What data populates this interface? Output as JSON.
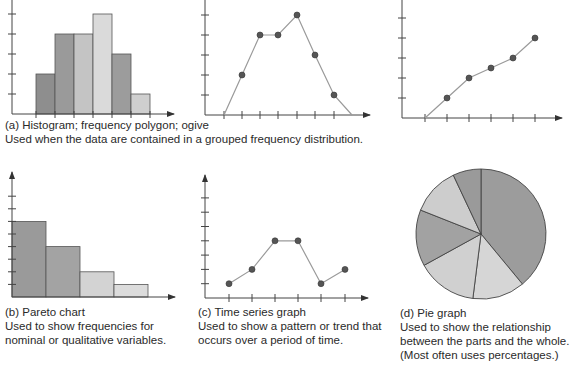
{
  "chart_data": [
    {
      "id": "a1",
      "type": "bar",
      "title": "Histogram",
      "categories": [
        "1",
        "2",
        "3",
        "4",
        "5",
        "6"
      ],
      "values": [
        2,
        4,
        4,
        5,
        3,
        1
      ],
      "bar_colors": [
        "#8e8e8e",
        "#9a9a9a",
        "#c4c4c4",
        "#dadada",
        "#9c9c9c",
        "#cfcfcf"
      ],
      "xlabel": "",
      "ylabel": "",
      "ylim": [
        0,
        6
      ],
      "grid": false,
      "tick_labels": false
    },
    {
      "id": "a2",
      "type": "line",
      "title": "Frequency polygon",
      "x": [
        0,
        1,
        2,
        3,
        4,
        5,
        6,
        7
      ],
      "values": [
        0,
        2,
        4,
        4,
        5,
        3,
        1,
        0
      ],
      "markers_on": [
        1,
        2,
        3,
        4,
        5,
        6
      ],
      "xlabel": "",
      "ylabel": "",
      "ylim": [
        0,
        6
      ],
      "grid": false
    },
    {
      "id": "a3",
      "type": "line",
      "title": "Ogive",
      "x": [
        0,
        1,
        2,
        3,
        4,
        5
      ],
      "values": [
        0,
        1,
        2,
        2.5,
        3,
        4
      ],
      "markers_on": [
        1,
        2,
        3,
        4,
        5
      ],
      "xlabel": "",
      "ylabel": "",
      "ylim": [
        0,
        6
      ],
      "grid": false
    },
    {
      "id": "b",
      "type": "bar",
      "title": "Pareto chart",
      "categories": [
        "1",
        "2",
        "3",
        "4"
      ],
      "values": [
        6,
        4,
        2,
        1
      ],
      "bar_colors": [
        "#9a9a9a",
        "#a3a3a3",
        "#d3d3d3",
        "#dcdcdc"
      ],
      "xlabel": "",
      "ylabel": "",
      "ylim": [
        0,
        8
      ],
      "grid": false
    },
    {
      "id": "c",
      "type": "line",
      "title": "Time series graph",
      "x": [
        1,
        2,
        3,
        4,
        5,
        6
      ],
      "values": [
        1,
        2,
        4,
        4,
        1,
        2
      ],
      "xlabel": "",
      "ylabel": "",
      "ylim": [
        0,
        7
      ],
      "grid": false
    },
    {
      "id": "d",
      "type": "pie",
      "title": "Pie graph",
      "values": [
        39,
        13,
        15,
        14,
        12,
        7
      ],
      "slice_colors": [
        "#9c9c9c",
        "#d6d6d6",
        "#d0d0d0",
        "#a2a2a2",
        "#cdcdcd",
        "#9a9a9a"
      ]
    }
  ],
  "captions": {
    "a": {
      "title": "(a) Histogram; frequency polygon; ogive",
      "desc": "Used when the data are contained in a grouped frequency distribution."
    },
    "b": {
      "title": "(b) Pareto chart",
      "line1": "Used to show frequencies for",
      "line2": "nominal or qualitative variables."
    },
    "c": {
      "title": "(c) Time series graph",
      "line1": "Used to show a pattern or trend that",
      "line2": "occurs over a period of time."
    },
    "d": {
      "title": "(d) Pie graph",
      "line1": "Used to show the relationship",
      "line2": "between the parts and the whole.",
      "line3": "(Most often uses percentages.)"
    }
  }
}
